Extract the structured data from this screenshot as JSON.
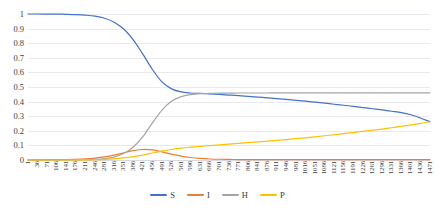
{
  "chart_data": {
    "type": "line",
    "title": "",
    "xlabel": "",
    "ylabel": "",
    "grid": true,
    "legend_position": "bottom",
    "xlim": [
      1,
      1471
    ],
    "ylim": [
      0,
      1
    ],
    "y_ticks": [
      "1",
      "0.9",
      "0.8",
      "0.7",
      "0.6",
      "0.5",
      "0.4",
      "0.3",
      "0.2",
      "0.1",
      "0"
    ],
    "y_tick_values": [
      1,
      0.9,
      0.8,
      0.7,
      0.6,
      0.5,
      0.4,
      0.3,
      0.2,
      0.1,
      0
    ],
    "x_ticks": [
      "1",
      "36",
      "71",
      "106",
      "141",
      "176",
      "211",
      "246",
      "281",
      "316",
      "351",
      "386",
      "421",
      "456",
      "491",
      "526",
      "561",
      "596",
      "631",
      "666",
      "701",
      "736",
      "771",
      "806",
      "841",
      "876",
      "911",
      "946",
      "981",
      "1016",
      "1051",
      "1086",
      "1121",
      "1156",
      "1191",
      "1226",
      "1261",
      "1296",
      "1331",
      "1366",
      "1401",
      "1436",
      "1471"
    ],
    "x": [
      1,
      36,
      71,
      106,
      141,
      176,
      211,
      246,
      281,
      316,
      351,
      386,
      421,
      456,
      491,
      526,
      561,
      596,
      631,
      666,
      701,
      736,
      771,
      806,
      841,
      876,
      911,
      946,
      981,
      1016,
      1051,
      1086,
      1121,
      1156,
      1191,
      1226,
      1261,
      1296,
      1331,
      1366,
      1401,
      1436,
      1471
    ],
    "series": [
      {
        "name": "S",
        "color": "#4472C4",
        "values": [
          1.0,
          1.0,
          0.999,
          0.999,
          0.998,
          0.996,
          0.992,
          0.985,
          0.971,
          0.944,
          0.897,
          0.823,
          0.725,
          0.62,
          0.535,
          0.487,
          0.466,
          0.459,
          0.456,
          0.452,
          0.449,
          0.445,
          0.441,
          0.436,
          0.431,
          0.426,
          0.421,
          0.415,
          0.409,
          0.403,
          0.396,
          0.389,
          0.382,
          0.375,
          0.367,
          0.359,
          0.351,
          0.343,
          0.334,
          0.325,
          0.31,
          0.288,
          0.262
        ]
      },
      {
        "name": "I",
        "color": "#ED7D31",
        "values": [
          0.001,
          0.001,
          0.002,
          0.002,
          0.003,
          0.005,
          0.008,
          0.013,
          0.021,
          0.033,
          0.049,
          0.064,
          0.072,
          0.069,
          0.056,
          0.04,
          0.026,
          0.017,
          0.011,
          0.007,
          0.005,
          0.004,
          0.003,
          0.003,
          0.002,
          0.002,
          0.002,
          0.002,
          0.002,
          0.002,
          0.002,
          0.002,
          0.002,
          0.002,
          0.002,
          0.002,
          0.002,
          0.002,
          0.002,
          0.002,
          0.002,
          0.002,
          0.002
        ]
      },
      {
        "name": "H",
        "color": "#A5A5A5",
        "values": [
          0.0,
          0.0,
          0.0,
          0.0,
          0.0,
          0.001,
          0.002,
          0.004,
          0.009,
          0.02,
          0.044,
          0.089,
          0.16,
          0.254,
          0.342,
          0.402,
          0.434,
          0.448,
          0.454,
          0.456,
          0.458,
          0.458,
          0.459,
          0.459,
          0.459,
          0.459,
          0.46,
          0.46,
          0.46,
          0.46,
          0.46,
          0.46,
          0.46,
          0.46,
          0.46,
          0.46,
          0.46,
          0.46,
          0.46,
          0.46,
          0.46,
          0.46,
          0.46
        ]
      },
      {
        "name": "P",
        "color": "#FFC000",
        "values": [
          0.0,
          0.0,
          0.0,
          0.0,
          0.0,
          0.0,
          0.001,
          0.002,
          0.004,
          0.008,
          0.014,
          0.023,
          0.034,
          0.048,
          0.061,
          0.072,
          0.081,
          0.088,
          0.094,
          0.099,
          0.104,
          0.109,
          0.114,
          0.119,
          0.124,
          0.129,
          0.134,
          0.14,
          0.146,
          0.152,
          0.159,
          0.166,
          0.173,
          0.18,
          0.188,
          0.196,
          0.204,
          0.212,
          0.221,
          0.23,
          0.24,
          0.251,
          0.262
        ]
      }
    ]
  },
  "legend": {
    "items": [
      {
        "label": "S",
        "color": "#4472C4"
      },
      {
        "label": "I",
        "color": "#ED7D31"
      },
      {
        "label": "H",
        "color": "#A5A5A5"
      },
      {
        "label": "P",
        "color": "#FFC000"
      }
    ]
  }
}
